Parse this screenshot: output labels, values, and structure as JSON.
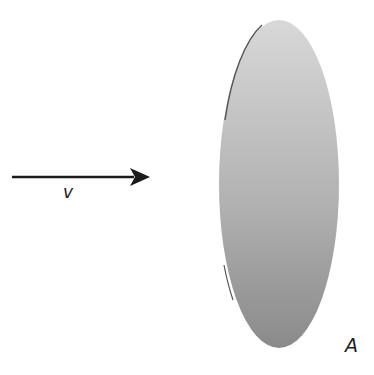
{
  "diagram": {
    "velocity_label": "v",
    "area_label": "A",
    "colors": {
      "arrow": "#1a1a1a",
      "surface_light": "#d6d6d6",
      "surface_dark": "#8f8f8f",
      "edge": "#555555"
    }
  }
}
